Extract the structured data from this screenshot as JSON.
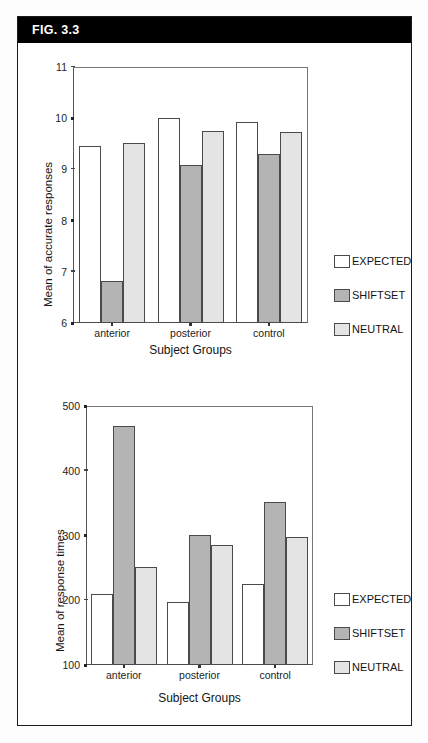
{
  "figure": {
    "label": "FIG. 3.3"
  },
  "legend_series": [
    {
      "key": "expected",
      "label": "EXPECTED",
      "color": "#ffffff"
    },
    {
      "key": "shiftset",
      "label": "SHIFTSET",
      "color": "#b4b4b4"
    },
    {
      "key": "neutral",
      "label": "NEUTRAL",
      "color": "#e4e4e4"
    }
  ],
  "chart_data": [
    {
      "type": "bar",
      "title": "",
      "xlabel": "Subject Groups",
      "ylabel": "Mean of accurate responses",
      "categories": [
        "anterior",
        "posterior",
        "control"
      ],
      "yticks": [
        "6",
        "7",
        "8",
        "9",
        "10",
        "11"
      ],
      "ylim": [
        6,
        11
      ],
      "grid": false,
      "legend_position": "right",
      "series": [
        {
          "name": "EXPECTED",
          "values": [
            9.45,
            10.0,
            9.92
          ]
        },
        {
          "name": "SHIFTSET",
          "values": [
            6.82,
            9.08,
            9.3
          ]
        },
        {
          "name": "NEUTRAL",
          "values": [
            9.52,
            9.75,
            9.74
          ]
        }
      ]
    },
    {
      "type": "bar",
      "title": "",
      "xlabel": "Subject Groups",
      "ylabel": "Mean of response times",
      "categories": [
        "anterior",
        "posterior",
        "control"
      ],
      "yticks": [
        "100",
        "200",
        "300",
        "400",
        "500"
      ],
      "ylim": [
        100,
        500
      ],
      "grid": false,
      "legend_position": "right",
      "series": [
        {
          "name": "EXPECTED",
          "values": [
            210,
            198,
            225
          ]
        },
        {
          "name": "SHIFTSET",
          "values": [
            469,
            301,
            352
          ]
        },
        {
          "name": "NEUTRAL",
          "values": [
            252,
            286,
            298
          ]
        }
      ]
    }
  ]
}
